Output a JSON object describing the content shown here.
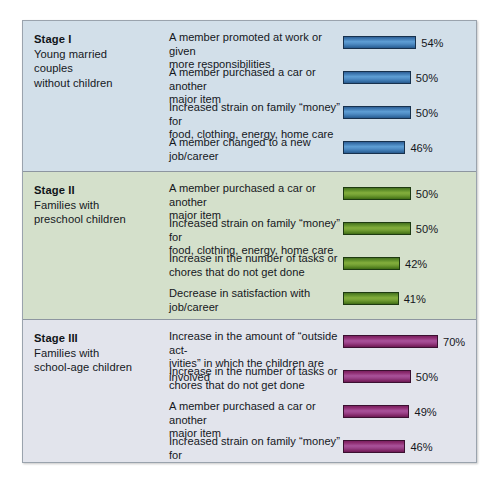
{
  "chart_data": {
    "type": "bar",
    "title": "",
    "xlabel": "",
    "ylabel": "",
    "units": "percent",
    "grid": false,
    "legend": "none",
    "orientation": "horizontal",
    "xlim": [
      0,
      70
    ],
    "groups": [
      {
        "group_title": "Stage I",
        "group_subtitle_lines": [
          "Young married",
          "couples",
          "without children"
        ],
        "bar_color": "#4f8cc4",
        "categories": [
          "A member promoted at work or given more responsibilities",
          "A member purchased a car or another major item",
          "Increased strain on family “money” for food, clothing, energy, home care",
          "A member changed to a new job/career"
        ],
        "values": [
          54,
          50,
          50,
          46
        ],
        "value_labels": [
          "54%",
          "50%",
          "50%",
          "46%"
        ],
        "category_lines": [
          [
            "A member promoted at work or given",
            "more responsibilities"
          ],
          [
            "A member purchased a car or another",
            "major item"
          ],
          [
            "Increased strain on family “money” for",
            "food, clothing, energy, home care"
          ],
          [
            "A member changed to a new",
            "job/career"
          ]
        ]
      },
      {
        "group_title": "Stage II",
        "group_subtitle_lines": [
          "Families with",
          "preschool children"
        ],
        "bar_color": "#74a034",
        "categories": [
          "A member purchased a car or another major item",
          "Increased strain on family “money” for food, clothing, energy, home care",
          "Increase in the number of tasks or chores that do not get done",
          "Decrease in satisfaction with job/career"
        ],
        "values": [
          50,
          50,
          42,
          41
        ],
        "value_labels": [
          "50%",
          "50%",
          "42%",
          "41%"
        ],
        "category_lines": [
          [
            "A member purchased a car or another",
            "major item"
          ],
          [
            "Increased strain on family “money” for",
            "food, clothing, energy, home care"
          ],
          [
            "Increase in the number of tasks or",
            "chores that do not get done"
          ],
          [
            "Decrease in satisfaction with",
            "job/career"
          ]
        ]
      },
      {
        "group_title": "Stage III",
        "group_subtitle_lines": [
          "Families with",
          "school-age children"
        ],
        "bar_color": "#9c4289",
        "categories": [
          "Increase in the amount of “outside activities” in which the children are involved",
          "Increase in the number of tasks or chores that do not get done",
          "A member purchased a car or another major item",
          "Increased strain on family “money” for food, clothing, energy, home care"
        ],
        "values": [
          70,
          50,
          49,
          46
        ],
        "value_labels": [
          "70%",
          "50%",
          "49%",
          "46%"
        ],
        "category_lines": [
          [
            "Increase in the amount of “outside act-",
            "ivities” in which the children are involved"
          ],
          [
            "Increase in the number of tasks or",
            "chores that do not get done"
          ],
          [
            "A member purchased a car or another",
            "major item"
          ],
          [
            "Increased strain on family “money” for",
            "food, clothing, energy, home care"
          ]
        ]
      }
    ]
  },
  "panels": {
    "stage1": {
      "title": "Stage I",
      "sub1": "Young married",
      "sub2": "couples",
      "sub3": "without children",
      "rows": [
        {
          "line1": "A member promoted at work or given",
          "line2": "more responsibilities",
          "value": "54%"
        },
        {
          "line1": "A member purchased a car or another",
          "line2": "major item",
          "value": "50%"
        },
        {
          "line1": "Increased strain on family “money” for",
          "line2": "food, clothing, energy, home care",
          "value": "50%"
        },
        {
          "line1": "A member changed to a new",
          "line2": "job/career",
          "value": "46%"
        }
      ]
    },
    "stage2": {
      "title": "Stage II",
      "sub1": "Families with",
      "sub2": "preschool children",
      "sub3": "",
      "rows": [
        {
          "line1": "A member purchased a car or another",
          "line2": "major item",
          "value": "50%"
        },
        {
          "line1": "Increased strain on family “money” for",
          "line2": "food, clothing, energy, home care",
          "value": "50%"
        },
        {
          "line1": "Increase in the number of tasks or",
          "line2": "chores that do not get done",
          "value": "42%"
        },
        {
          "line1": "Decrease in satisfaction with",
          "line2": "job/career",
          "value": "41%"
        }
      ]
    },
    "stage3": {
      "title": "Stage III",
      "sub1": "Families with",
      "sub2": "school-age children",
      "sub3": "",
      "rows": [
        {
          "line1": "Increase in the amount of “outside act-",
          "line2": "ivities” in which the children are involved",
          "value": "70%"
        },
        {
          "line1": "Increase in the number of tasks or",
          "line2": "chores that do not get done",
          "value": "50%"
        },
        {
          "line1": "A member purchased a car or another",
          "line2": "major item",
          "value": "49%"
        },
        {
          "line1": "Increased strain on family “money” for",
          "line2": "food, clothing, energy, home care",
          "value": "46%"
        }
      ]
    }
  },
  "colors": {
    "stage1_bg": "#d2dfe9",
    "stage2_bg": "#d4e0cb",
    "stage3_bg": "#e2e4ec",
    "bar_blue": "#4f8cc4",
    "bar_green": "#74a034",
    "bar_magenta": "#9c4289",
    "frame_border": "#9aa3ad",
    "text": "#14171c"
  }
}
